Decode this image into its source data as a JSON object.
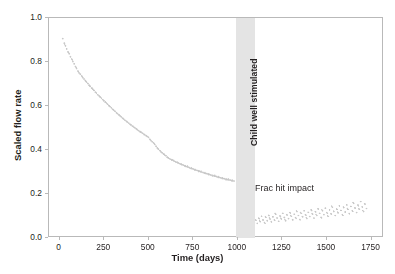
{
  "figure": {
    "axis_title_x": "Time (days)",
    "axis_title_y": "Scaled flow rate",
    "band_label": "Child well stimulated",
    "annotation": "Frac hit impact",
    "caption": "",
    "colors": {
      "marker": "#c8c8c8",
      "band": "#e4e4e4",
      "frame": "#b9b9b9",
      "text": "#231f20",
      "background": "#ffffff"
    }
  },
  "chart_data": {
    "type": "scatter",
    "title": "",
    "xlabel": "Time (days)",
    "ylabel": "Scaled flow rate",
    "xlim": [
      -60,
      1820
    ],
    "ylim": [
      0.0,
      1.0
    ],
    "grid": false,
    "legend": null,
    "xticks": [
      0,
      250,
      500,
      750,
      1000,
      1250,
      1500,
      1750
    ],
    "yticks": [
      0.0,
      0.2,
      0.4,
      0.6,
      0.8,
      1.0
    ],
    "annotations": [
      {
        "text": "Child well stimulated",
        "x": 1040,
        "y": 0.62,
        "rotation": 90,
        "type": "band-label"
      },
      {
        "text": "Frac hit impact",
        "x": 1320,
        "y": 0.225,
        "rotation": 0,
        "type": "text"
      }
    ],
    "shaded_regions": [
      {
        "label": "Child well stimulated",
        "x_start": 990,
        "x_end": 1095,
        "color": "#e4e4e4"
      }
    ],
    "series": [
      {
        "name": "Parent well scaled flow rate",
        "marker": "point",
        "color": "#c8c8c8",
        "points": [
          [
            18,
            0.905
          ],
          [
            26,
            0.885
          ],
          [
            33,
            0.872
          ],
          [
            40,
            0.858
          ],
          [
            47,
            0.845
          ],
          [
            54,
            0.836
          ],
          [
            61,
            0.822
          ],
          [
            68,
            0.812
          ],
          [
            75,
            0.8
          ],
          [
            82,
            0.79
          ],
          [
            89,
            0.778
          ],
          [
            96,
            0.768
          ],
          [
            103,
            0.757
          ],
          [
            110,
            0.748
          ],
          [
            117,
            0.742
          ],
          [
            124,
            0.735
          ],
          [
            131,
            0.726
          ],
          [
            138,
            0.72
          ],
          [
            145,
            0.713
          ],
          [
            152,
            0.706
          ],
          [
            159,
            0.7
          ],
          [
            166,
            0.692
          ],
          [
            173,
            0.686
          ],
          [
            180,
            0.679
          ],
          [
            187,
            0.674
          ],
          [
            194,
            0.668
          ],
          [
            201,
            0.66
          ],
          [
            208,
            0.655
          ],
          [
            215,
            0.648
          ],
          [
            222,
            0.643
          ],
          [
            229,
            0.637
          ],
          [
            236,
            0.632
          ],
          [
            243,
            0.626
          ],
          [
            250,
            0.62
          ],
          [
            257,
            0.614
          ],
          [
            264,
            0.61
          ],
          [
            271,
            0.604
          ],
          [
            278,
            0.598
          ],
          [
            285,
            0.593
          ],
          [
            292,
            0.588
          ],
          [
            299,
            0.582
          ],
          [
            306,
            0.577
          ],
          [
            313,
            0.572
          ],
          [
            320,
            0.566
          ],
          [
            327,
            0.561
          ],
          [
            334,
            0.556
          ],
          [
            341,
            0.551
          ],
          [
            348,
            0.546
          ],
          [
            355,
            0.541
          ],
          [
            362,
            0.536
          ],
          [
            369,
            0.531
          ],
          [
            376,
            0.527
          ],
          [
            383,
            0.522
          ],
          [
            390,
            0.518
          ],
          [
            397,
            0.513
          ],
          [
            404,
            0.509
          ],
          [
            411,
            0.504
          ],
          [
            418,
            0.5
          ],
          [
            425,
            0.496
          ],
          [
            432,
            0.492
          ],
          [
            439,
            0.487
          ],
          [
            446,
            0.483
          ],
          [
            453,
            0.479
          ],
          [
            460,
            0.476
          ],
          [
            467,
            0.472
          ],
          [
            474,
            0.468
          ],
          [
            481,
            0.464
          ],
          [
            488,
            0.46
          ],
          [
            495,
            0.456
          ],
          [
            502,
            0.452
          ],
          [
            509,
            0.444
          ],
          [
            516,
            0.437
          ],
          [
            523,
            0.432
          ],
          [
            530,
            0.428
          ],
          [
            537,
            0.42
          ],
          [
            544,
            0.412
          ],
          [
            551,
            0.404
          ],
          [
            558,
            0.398
          ],
          [
            565,
            0.392
          ],
          [
            572,
            0.386
          ],
          [
            579,
            0.381
          ],
          [
            586,
            0.376
          ],
          [
            593,
            0.372
          ],
          [
            600,
            0.368
          ],
          [
            607,
            0.362
          ],
          [
            614,
            0.358
          ],
          [
            621,
            0.355
          ],
          [
            628,
            0.352
          ],
          [
            635,
            0.349
          ],
          [
            642,
            0.346
          ],
          [
            649,
            0.343
          ],
          [
            656,
            0.34
          ],
          [
            663,
            0.338
          ],
          [
            670,
            0.335
          ],
          [
            677,
            0.332
          ],
          [
            684,
            0.33
          ],
          [
            691,
            0.327
          ],
          [
            698,
            0.325
          ],
          [
            705,
            0.322
          ],
          [
            712,
            0.32
          ],
          [
            719,
            0.318
          ],
          [
            726,
            0.316
          ],
          [
            733,
            0.313
          ],
          [
            740,
            0.311
          ],
          [
            747,
            0.309
          ],
          [
            754,
            0.307
          ],
          [
            761,
            0.305
          ],
          [
            768,
            0.303
          ],
          [
            775,
            0.301
          ],
          [
            782,
            0.299
          ],
          [
            789,
            0.297
          ],
          [
            796,
            0.295
          ],
          [
            803,
            0.293
          ],
          [
            810,
            0.291
          ],
          [
            817,
            0.289
          ],
          [
            824,
            0.287
          ],
          [
            831,
            0.286
          ],
          [
            838,
            0.284
          ],
          [
            845,
            0.282
          ],
          [
            852,
            0.28
          ],
          [
            859,
            0.279
          ],
          [
            866,
            0.277
          ],
          [
            873,
            0.275
          ],
          [
            880,
            0.274
          ],
          [
            887,
            0.272
          ],
          [
            894,
            0.27
          ],
          [
            901,
            0.269
          ],
          [
            908,
            0.267
          ],
          [
            915,
            0.266
          ],
          [
            922,
            0.264
          ],
          [
            929,
            0.263
          ],
          [
            936,
            0.261
          ],
          [
            943,
            0.26
          ],
          [
            950,
            0.258
          ],
          [
            957,
            0.257
          ],
          [
            964,
            0.256
          ],
          [
            971,
            0.254
          ],
          [
            978,
            0.253
          ],
          [
            985,
            0.252
          ],
          [
            1100,
            0.06
          ],
          [
            1108,
            0.072
          ],
          [
            1116,
            0.058
          ],
          [
            1124,
            0.082
          ],
          [
            1132,
            0.066
          ],
          [
            1140,
            0.09
          ],
          [
            1148,
            0.074
          ],
          [
            1156,
            0.062
          ],
          [
            1164,
            0.086
          ],
          [
            1172,
            0.07
          ],
          [
            1180,
            0.095
          ],
          [
            1188,
            0.078
          ],
          [
            1196,
            0.064
          ],
          [
            1204,
            0.088
          ],
          [
            1212,
            0.074
          ],
          [
            1220,
            0.1
          ],
          [
            1228,
            0.082
          ],
          [
            1236,
            0.068
          ],
          [
            1244,
            0.092
          ],
          [
            1252,
            0.078
          ],
          [
            1260,
            0.104
          ],
          [
            1268,
            0.086
          ],
          [
            1276,
            0.07
          ],
          [
            1284,
            0.096
          ],
          [
            1292,
            0.08
          ],
          [
            1300,
            0.108
          ],
          [
            1308,
            0.09
          ],
          [
            1316,
            0.074
          ],
          [
            1324,
            0.1
          ],
          [
            1332,
            0.084
          ],
          [
            1340,
            0.112
          ],
          [
            1348,
            0.094
          ],
          [
            1356,
            0.076
          ],
          [
            1364,
            0.104
          ],
          [
            1372,
            0.088
          ],
          [
            1380,
            0.116
          ],
          [
            1388,
            0.098
          ],
          [
            1396,
            0.08
          ],
          [
            1404,
            0.108
          ],
          [
            1412,
            0.09
          ],
          [
            1420,
            0.12
          ],
          [
            1428,
            0.1
          ],
          [
            1436,
            0.082
          ],
          [
            1444,
            0.112
          ],
          [
            1452,
            0.094
          ],
          [
            1460,
            0.124
          ],
          [
            1468,
            0.104
          ],
          [
            1476,
            0.086
          ],
          [
            1484,
            0.116
          ],
          [
            1492,
            0.098
          ],
          [
            1500,
            0.128
          ],
          [
            1508,
            0.108
          ],
          [
            1516,
            0.09
          ],
          [
            1524,
            0.12
          ],
          [
            1532,
            0.102
          ],
          [
            1540,
            0.132
          ],
          [
            1548,
            0.112
          ],
          [
            1556,
            0.094
          ],
          [
            1564,
            0.124
          ],
          [
            1572,
            0.106
          ],
          [
            1580,
            0.138
          ],
          [
            1588,
            0.118
          ],
          [
            1596,
            0.098
          ],
          [
            1604,
            0.13
          ],
          [
            1612,
            0.11
          ],
          [
            1620,
            0.144
          ],
          [
            1628,
            0.122
          ],
          [
            1636,
            0.102
          ],
          [
            1644,
            0.136
          ],
          [
            1652,
            0.116
          ],
          [
            1660,
            0.15
          ],
          [
            1668,
            0.128
          ],
          [
            1676,
            0.108
          ],
          [
            1684,
            0.142
          ],
          [
            1692,
            0.122
          ],
          [
            1700,
            0.158
          ],
          [
            1708,
            0.134
          ],
          [
            1716,
            0.112
          ],
          [
            1724,
            0.146
          ],
          [
            1732,
            0.126
          ]
        ]
      }
    ]
  }
}
